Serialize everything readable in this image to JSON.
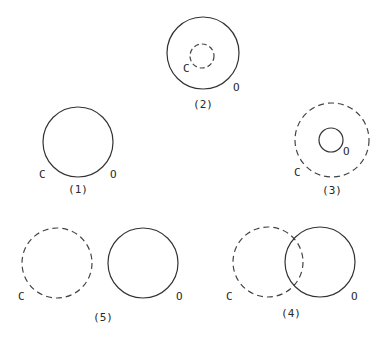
{
  "figures": [
    {
      "id": "fig2",
      "caption": "(2)",
      "label_c": "C",
      "label_o": "O",
      "relation": "C inside O"
    },
    {
      "id": "fig1",
      "caption": "(1)",
      "label_c": "C",
      "label_o": "O",
      "relation": "C coincides with O"
    },
    {
      "id": "fig3",
      "caption": "(3)",
      "label_c": "C",
      "label_o": "O",
      "relation": "O inside C"
    },
    {
      "id": "fig5",
      "caption": "(5)",
      "label_c": "C",
      "label_o": "O",
      "relation": "C and O disjoint"
    },
    {
      "id": "fig4",
      "caption": "(4)",
      "label_c": "C",
      "label_o": "O",
      "relation": "C and O overlap"
    }
  ],
  "legend": {
    "dashed": "C",
    "solid": "O"
  }
}
